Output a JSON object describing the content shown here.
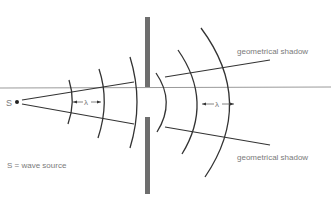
{
  "diagram": {
    "source_label": "S",
    "legend": "S = wave source",
    "wavelength_symbol": "λ",
    "shadow_label_top": "geometrical shadow",
    "shadow_label_bottom": "geometrical shadow",
    "colors": {
      "wave": "#333333",
      "barrier": "#6e6e6e",
      "axis": "#9a9a9a",
      "text": "#7a7a7a"
    }
  }
}
